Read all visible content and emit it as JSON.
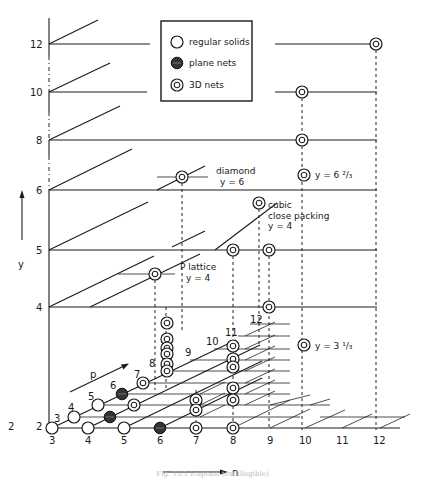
{
  "legend": {
    "items": [
      {
        "symbol": "open-circle",
        "label": "regular solids"
      },
      {
        "symbol": "filled-circle",
        "label": "plane nets"
      },
      {
        "symbol": "double-circle",
        "label": "3D nets"
      }
    ]
  },
  "axes": {
    "y_label": "y",
    "n_label": "n",
    "p_label": "p",
    "y_ticks": [
      "2",
      "4",
      "5",
      "6",
      "8",
      "10",
      "12"
    ],
    "n_ticks": [
      "3",
      "4",
      "5",
      "6",
      "7",
      "8",
      "9",
      "10",
      "11",
      "12"
    ],
    "p_ticks": [
      "3",
      "4",
      "5",
      "6",
      "7",
      "8",
      "9",
      "10",
      "11",
      "12"
    ]
  },
  "annotations": {
    "diamond": "diamond",
    "diamond_y": "y = 6",
    "ccp_1": "cubic",
    "ccp_2": "close packing",
    "ccp_y": "y = 4",
    "plattice_1": "P lattice",
    "plattice_y": "y = 4",
    "y623": "y = 6 ²/₃",
    "y313": "y = 3 ¹/₃"
  },
  "caption": "Fig. 13.1 (caption text illegible)"
}
